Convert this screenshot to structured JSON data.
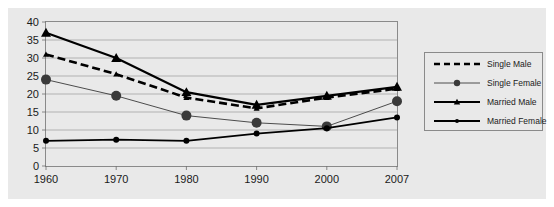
{
  "chart_data": {
    "type": "line",
    "title": "",
    "subtitle": "",
    "xlabel": "",
    "ylabel": "",
    "categories": [
      "1960",
      "1970",
      "1980",
      "1990",
      "2000",
      "2007"
    ],
    "x": [
      1960,
      1970,
      1980,
      1990,
      2000,
      2007
    ],
    "ylim": [
      0,
      40
    ],
    "xlim_categories": [
      "1960",
      "2007"
    ],
    "y_ticks": [
      "0",
      "5",
      "10",
      "15",
      "20",
      "25",
      "30",
      "35",
      "40"
    ],
    "y_tick_values": [
      0,
      5,
      10,
      15,
      20,
      25,
      30,
      35,
      40
    ],
    "grid": true,
    "grid_axis": "y",
    "legend_position": "right",
    "plot_background": "#e9e9e9",
    "series": [
      {
        "name": "Single Male",
        "values": [
          31,
          25.5,
          19,
          16,
          19,
          21.5
        ],
        "color": "#000000",
        "line_style": "dashed",
        "line_width": 2.6,
        "marker": "triangle",
        "marker_size": 3
      },
      {
        "name": "Single Female",
        "values": [
          24,
          19.5,
          14,
          12,
          11,
          18
        ],
        "color": "#3a3a3a",
        "line_style": "solid",
        "line_width": 0.9,
        "marker": "circle",
        "marker_size": 5
      },
      {
        "name": "Married Male",
        "values": [
          37,
          30,
          20.5,
          17,
          19.5,
          22
        ],
        "color": "#000000",
        "line_style": "solid",
        "line_width": 2.2,
        "marker": "triangle",
        "marker_size": 5
      },
      {
        "name": "Married Female",
        "values": [
          7,
          7.3,
          7,
          9,
          10.5,
          13.5
        ],
        "color": "#000000",
        "line_style": "solid",
        "line_width": 1.8,
        "marker": "circle",
        "marker_size": 3
      }
    ]
  },
  "axis": {
    "y_labels": [
      "40",
      "35",
      "30",
      "25",
      "20",
      "15",
      "10",
      "5",
      "0"
    ],
    "x_labels": [
      "1960",
      "1970",
      "1980",
      "1990",
      "2000",
      "2007"
    ]
  },
  "legend": {
    "items": [
      {
        "label": "Single Male",
        "style": "dashed-thick",
        "marker": "none"
      },
      {
        "label": "Single Female",
        "style": "thin",
        "marker": "circle-large"
      },
      {
        "label": "Married Male",
        "style": "thick",
        "marker": "triangle"
      },
      {
        "label": "Married Female",
        "style": "thick",
        "marker": "dot-small"
      }
    ]
  }
}
